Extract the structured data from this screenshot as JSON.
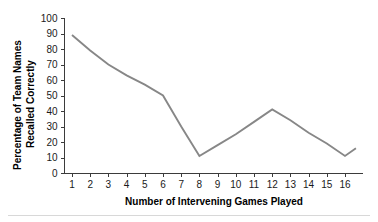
{
  "chart_data": {
    "type": "line",
    "title": "",
    "xlabel": "Number of Intervening Games Played",
    "ylabel": "Percentage of Team Names Recalled Correctly",
    "ylabel_line1": "Percentage of Team Names",
    "ylabel_line2": "Recalled Correctly",
    "x": [
      1,
      2,
      3,
      4,
      5,
      6,
      7,
      8,
      9,
      10,
      11,
      12,
      13,
      14,
      15,
      16,
      16.6
    ],
    "values": [
      89,
      79,
      70,
      63,
      57,
      50,
      30,
      11,
      18,
      25,
      33,
      41,
      34,
      26,
      19,
      11,
      16
    ],
    "series": [
      {
        "name": "Percentage recalled",
        "values": [
          89,
          79,
          70,
          63,
          57,
          50,
          30,
          11,
          18,
          25,
          33,
          41,
          34,
          26,
          19,
          11,
          16
        ]
      }
    ],
    "xlim": [
      0.5,
      16.8
    ],
    "ylim": [
      0,
      100
    ],
    "ytick_values": [
      0,
      10,
      20,
      30,
      40,
      50,
      60,
      70,
      80,
      90,
      100
    ],
    "ytick_labels": [
      "0",
      "10",
      "20",
      "30",
      "40",
      "50",
      "60",
      "70",
      "80",
      "90",
      "100"
    ],
    "xtick_values": [
      1,
      2,
      3,
      4,
      5,
      6,
      7,
      8,
      9,
      10,
      11,
      12,
      13,
      14,
      15,
      16
    ],
    "xtick_labels": [
      "1",
      "2",
      "3",
      "4",
      "5",
      "6",
      "7",
      "8",
      "9",
      "10",
      "11",
      "12",
      "13",
      "14",
      "15",
      "16"
    ],
    "grid": false,
    "legend": false,
    "legend_position": "none",
    "line_color": "#878787",
    "axis_color": "#3b3b3b",
    "text_color": "#1a1a1a",
    "background_color": "#ffffff"
  }
}
